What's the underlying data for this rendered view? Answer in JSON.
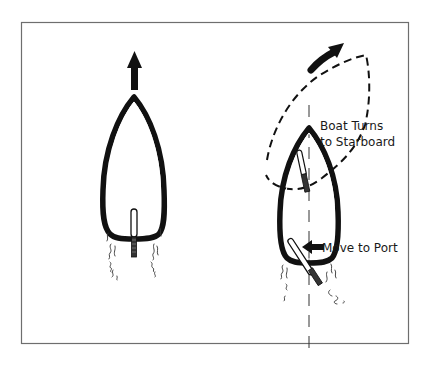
{
  "diagram": {
    "title": "",
    "colors": {
      "background": "#ffffff",
      "frame": "#6e6e6e",
      "ink": "#111111",
      "hull_inner": "#ffffff"
    },
    "panels": [
      {
        "id": "straight",
        "boat_heading": "straight-ahead",
        "arrow": "up-arrow",
        "tiller": "centered"
      },
      {
        "id": "turn",
        "boat_heading": "turning-starboard",
        "arrow": "curved-up-right-arrow",
        "tiller": "pushed-to-port",
        "labels": {
          "turn": [
            "Boat Turns",
            "to Starboard"
          ],
          "tiller_action": "Move to Port"
        }
      }
    ]
  }
}
